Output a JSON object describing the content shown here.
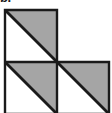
{
  "figure": {
    "title_fragment": "b.",
    "colors": {
      "shaded_fill": "#a5a5a5",
      "unshaded_fill": "#ffffff",
      "stroke": "#1a1a1a",
      "background": "#ffffff"
    },
    "geometry": {
      "unit": 52,
      "origin_x": 5,
      "origin_y": 10,
      "stroke_width": 2.4,
      "diagonal_width": 2.8
    },
    "squares": [
      {
        "name": "top-left-square",
        "col": 0,
        "row": 0,
        "x": 5,
        "y": 10,
        "size": 52,
        "diagonal": "top-left-to-bottom-right",
        "shaded_half": "upper-right"
      },
      {
        "name": "bottom-left-square",
        "col": 0,
        "row": 1,
        "x": 5,
        "y": 62,
        "size": 52,
        "diagonal": "top-left-to-bottom-right",
        "shaded_half": "upper-right"
      },
      {
        "name": "bottom-right-square",
        "col": 1,
        "row": 1,
        "x": 57,
        "y": 62,
        "size": 52,
        "diagonal": "top-left-to-bottom-right",
        "shaded_half": "upper-right"
      }
    ]
  }
}
